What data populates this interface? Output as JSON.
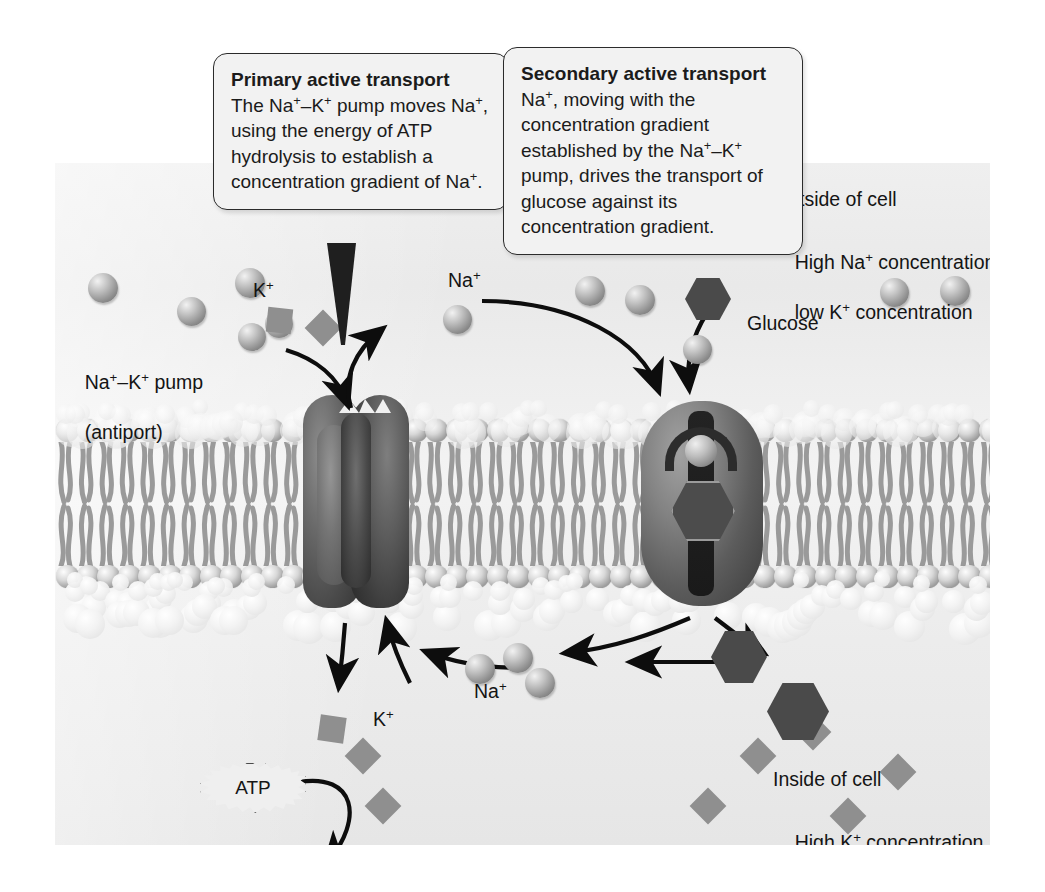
{
  "figure": {
    "callouts": [
      {
        "id": "primary",
        "title": "Primary active transport",
        "body": "The Na+–K+ pump moves Na+, using the energy of ATP hydrolysis to establish a concentration gradient of Na+."
      },
      {
        "id": "secondary",
        "title": "Secondary active transport",
        "body": "Na+, moving with the concentration gradient established by the Na+–K+ pump, drives the transport of glucose against its concentration gradient."
      }
    ],
    "labels": {
      "outside_of_cell": "Outside of cell",
      "outside_conc_line1": "High Na+ concentration,",
      "outside_conc_line2": "low K+ concentration",
      "inside_of_cell": "Inside of cell",
      "inside_conc_line1": "High K+ concentration,",
      "inside_conc_line2": "low Na+ concentration",
      "pump_line1": "Na+–K+ pump",
      "pump_line2": "(antiport)",
      "k_out": "K+",
      "na_out": "Na+",
      "glucose": "Glucose",
      "na_in": "Na+",
      "k_in": "K+",
      "atp": "ATP",
      "adp": "ADP",
      "plus": "+",
      "pi": "Pi"
    },
    "colors": {
      "panel_background": "#ececec",
      "membrane_head": "#9f9f9f",
      "membrane_tail": "#9a9a9a",
      "protein_dark": "#3b3b3b",
      "sodium_ion": "#8d8d8d",
      "potassium_ion": "#8f8f8f",
      "glucose": "#4a4a4a",
      "arrow": "#0d0d0d",
      "callout_fill": "#f2f2f2",
      "callout_border": "#2b2b2b",
      "text": "#141414"
    },
    "species": {
      "sodium_out_count": 9,
      "sodium_in_count": 3,
      "potassium_out_count": 2,
      "potassium_in_count": 11,
      "glucose_out_count": 1,
      "glucose_in_count": 2
    }
  }
}
